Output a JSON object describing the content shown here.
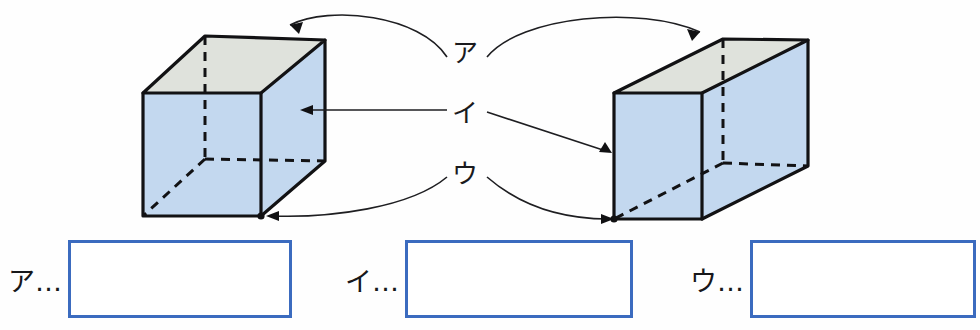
{
  "page": {
    "type": "worksheet"
  },
  "colors": {
    "box_border": "#3b6bbf",
    "top_face": "#dfe2dc",
    "side_face": "#c3d8ef",
    "edge": "#121214",
    "connector": "#1e1e21",
    "background": "#ffffff"
  },
  "figure": {
    "left_solid": {
      "name": "cube",
      "top_face_label": "top-face",
      "front_face_label": "front-face",
      "right_face_label": "right-face"
    },
    "right_solid": {
      "name": "rectangular-prism",
      "top_face_label": "top-face",
      "left_face_label": "left-face",
      "front_face_label": "front-face"
    },
    "callouts": [
      {
        "key": "a",
        "label": "ア",
        "points_to": "top-face"
      },
      {
        "key": "i",
        "label": "イ",
        "points_to": "vertical-side-face"
      },
      {
        "key": "u",
        "label": "ウ",
        "points_to": "bottom-front-vertex"
      }
    ]
  },
  "answers": [
    {
      "key": "a",
      "label": "ア…",
      "value": "",
      "placeholder": ""
    },
    {
      "key": "i",
      "label": "イ…",
      "value": "",
      "placeholder": ""
    },
    {
      "key": "u",
      "label": "ウ…",
      "value": "",
      "placeholder": ""
    }
  ]
}
